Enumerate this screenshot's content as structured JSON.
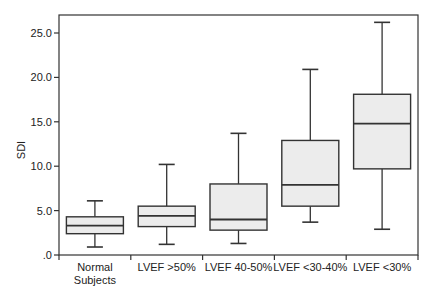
{
  "chart_data": {
    "type": "boxplot",
    "title": "",
    "xlabel": "",
    "ylabel": "SDI",
    "ylim": [
      0,
      25
    ],
    "yticks": [
      0,
      5,
      10,
      15,
      20,
      25
    ],
    "ytick_labels": [
      ".0",
      "5.0",
      "10.0",
      "15.0",
      "20.0",
      "25.0"
    ],
    "grid": false,
    "legend": null,
    "categories": [
      [
        "Normal",
        "Subjects"
      ],
      [
        "LVEF >50%"
      ],
      [
        "LVEF 40-50%"
      ],
      [
        "LVEF <30-40%"
      ],
      [
        "LVEF <30%"
      ]
    ],
    "series": [
      {
        "name": "Normal Subjects",
        "min": 0.9,
        "q1": 2.4,
        "median": 3.3,
        "q3": 4.3,
        "max": 6.1
      },
      {
        "name": "LVEF >50%",
        "min": 1.2,
        "q1": 3.2,
        "median": 4.4,
        "q3": 5.5,
        "max": 10.2
      },
      {
        "name": "LVEF 40-50%",
        "min": 1.3,
        "q1": 2.8,
        "median": 4.0,
        "q3": 8.0,
        "max": 13.7
      },
      {
        "name": "LVEF <30-40%",
        "min": 3.7,
        "q1": 5.5,
        "median": 7.9,
        "q3": 12.9,
        "max": 20.9
      },
      {
        "name": "LVEF <30%",
        "min": 2.9,
        "q1": 9.7,
        "median": 14.8,
        "q3": 18.1,
        "max": 26.2
      }
    ],
    "colors": {
      "box_fill": "#ececec",
      "line": "#333333",
      "axis": "#333333"
    }
  }
}
